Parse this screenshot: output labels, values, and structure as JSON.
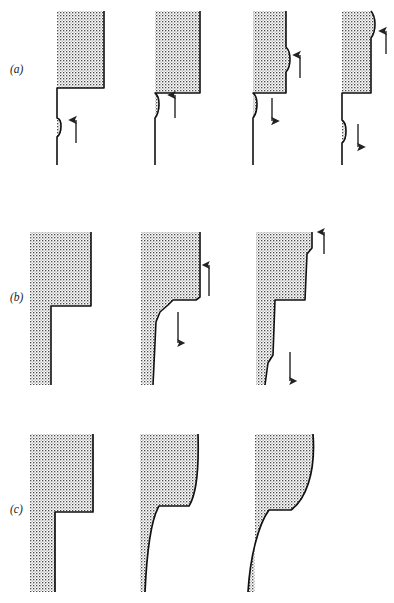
{
  "figure": {
    "title": "",
    "background_color": "#ffffff",
    "line_color": "#111111",
    "stipple_color": "#3a3a3a",
    "arrow_color": "#222222",
    "width": 394,
    "height": 603,
    "rows": [
      {
        "id": "a",
        "label": "(a)",
        "label_x": 10,
        "label_y": 70,
        "description": "atomically-rough kink migration sequence",
        "panels": [
          {
            "id": "a1",
            "arrows": [
              {
                "direction": "up",
                "x": 76,
                "y": 133,
                "length": 28,
                "label": ""
              }
            ]
          },
          {
            "id": "a2",
            "arrows": [
              {
                "direction": "up",
                "x": 175,
                "y": 108,
                "length": 28,
                "label": ""
              }
            ]
          },
          {
            "id": "a3",
            "arrows": [
              {
                "direction": "up",
                "x": 290,
                "y": 68,
                "length": 28,
                "label": ""
              },
              {
                "direction": "down",
                "x": 278,
                "y": 108,
                "length": 28,
                "label": ""
              }
            ]
          },
          {
            "id": "a4",
            "arrows": [
              {
                "direction": "up",
                "x": 384,
                "y": 32,
                "length": 28,
                "label": ""
              },
              {
                "direction": "down",
                "x": 373,
                "y": 133,
                "length": 28,
                "label": ""
              }
            ]
          }
        ]
      },
      {
        "id": "b",
        "label": "(b)",
        "label_x": 10,
        "label_y": 298,
        "description": "vicinal stepped surface, steps separating",
        "panels": [
          {
            "id": "b1",
            "arrows": []
          },
          {
            "id": "b2",
            "arrows": [
              {
                "direction": "up",
                "x": 209,
                "y": 281,
                "length": 30,
                "label": ""
              },
              {
                "direction": "down",
                "x": 178,
                "y": 325,
                "length": 30,
                "label": ""
              }
            ]
          },
          {
            "id": "b3",
            "arrows": [
              {
                "direction": "up",
                "x": 324,
                "y": 238,
                "length": 30,
                "label": ""
              },
              {
                "direction": "down",
                "x": 290,
                "y": 365,
                "length": 30,
                "label": ""
              }
            ]
          }
        ]
      },
      {
        "id": "c",
        "label": "(c)",
        "label_x": 10,
        "label_y": 510,
        "description": "continuum rounded interface evolution",
        "panels": [
          {
            "id": "c1",
            "arrows": []
          },
          {
            "id": "c2",
            "arrows": []
          },
          {
            "id": "c3",
            "arrows": []
          }
        ]
      }
    ]
  }
}
